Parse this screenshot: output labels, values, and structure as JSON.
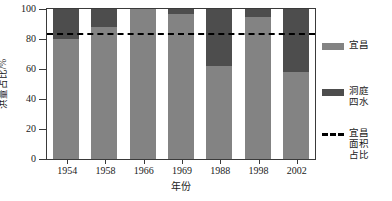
{
  "chart_data": {
    "type": "bar",
    "stacked": true,
    "title": "",
    "xlabel": "年份",
    "ylabel": "洪量占比/%",
    "categories": [
      "1954",
      "1958",
      "1966",
      "1969",
      "1988",
      "1998",
      "2002"
    ],
    "ylim": [
      0,
      100
    ],
    "yticks": [
      0,
      20,
      40,
      60,
      80,
      100
    ],
    "ytick_labels": [
      "0",
      "20",
      "40",
      "60",
      "80",
      "100"
    ],
    "grid": false,
    "legend_position": "right",
    "series": [
      {
        "name": "宜昌",
        "color": "#838383",
        "values": [
          80,
          88,
          100,
          97,
          62,
          95,
          58
        ]
      },
      {
        "name": "洞庭四水",
        "color": "#4d4d4d",
        "values": [
          20,
          12,
          0,
          3,
          38,
          5,
          42
        ]
      }
    ],
    "reference_line": {
      "name": "宜昌面积占比",
      "value": 82.5,
      "style": "dashed",
      "color": "#000000"
    }
  },
  "legend": {
    "items": [
      {
        "label": "宜昌",
        "marker": "solid-swatch",
        "color": "#838383"
      },
      {
        "label": "洞庭\n四水",
        "marker": "solid-swatch",
        "color": "#4d4d4d"
      },
      {
        "label": "宜昌\n面积\n占比",
        "marker": "dashed-line",
        "color": "#000000"
      }
    ]
  }
}
